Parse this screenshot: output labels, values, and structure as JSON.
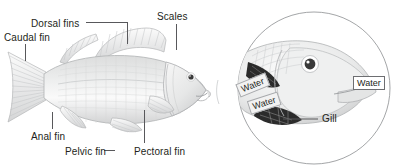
{
  "figure": {
    "title_visible": false,
    "background_color": "#ffffff",
    "text_color": "#231f20",
    "line_color": "#58585b"
  },
  "main_fish": {
    "name": "perch-side-view",
    "labels": [
      {
        "id": "caudal-fin",
        "text": "Caudal fin",
        "x": 4,
        "y": 32
      },
      {
        "id": "dorsal-fins",
        "text": "Dorsal fins",
        "x": 31,
        "y": 18
      },
      {
        "id": "scales",
        "text": "Scales",
        "x": 157,
        "y": 11
      },
      {
        "id": "anal-fin",
        "text": "Anal fin",
        "x": 31,
        "y": 131
      },
      {
        "id": "pelvic-fin",
        "text": "Pelvic fin",
        "x": 65,
        "y": 146
      },
      {
        "id": "pectoral-fin",
        "text": "Pectoral fin",
        "x": 134,
        "y": 146
      }
    ]
  },
  "inset": {
    "name": "gill-detail-circle",
    "labels": [
      {
        "id": "gill",
        "text": "Gill",
        "x": 322,
        "y": 117
      }
    ],
    "water_tags": [
      {
        "id": "water-in-upper",
        "text": "Water",
        "x": 238,
        "y": 88,
        "rotate": -22,
        "style": "shaded"
      },
      {
        "id": "water-in-lower",
        "text": "Water",
        "x": 249,
        "y": 105,
        "rotate": -18,
        "style": "shaded"
      },
      {
        "id": "water-mouth",
        "text": "Water",
        "x": 353,
        "y": 80,
        "rotate": 0,
        "style": "plain"
      }
    ]
  },
  "colors": {
    "fish_light": "#f1f1f1",
    "fish_mid": "#d9dada",
    "fish_shadow": "#bcbec0",
    "outline": "#a7a9ac",
    "dark_arrow": "#2b2b2b",
    "eye": "#3a3a3a"
  }
}
